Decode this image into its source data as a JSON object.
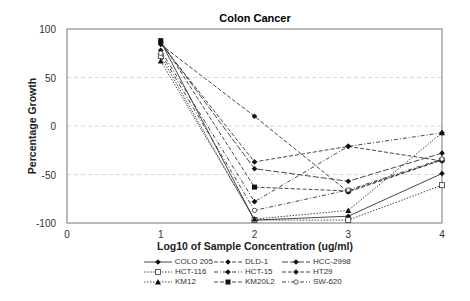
{
  "chart_data": {
    "type": "line",
    "title": "Colon Cancer",
    "xlabel": "Log10 of Sample Concentration (ug/ml)",
    "ylabel": "Percentage Growth",
    "xlim": [
      0,
      4
    ],
    "ylim": [
      -100,
      100
    ],
    "x_ticks": [
      "0",
      "1",
      "2",
      "3",
      "4"
    ],
    "y_ticks": [
      "100",
      "50",
      "0",
      "-50",
      "-100"
    ],
    "grid": "horizontal dashed at 50, 0, -50",
    "legend_position": "bottom",
    "x": [
      1,
      2,
      3,
      4
    ],
    "series": [
      {
        "name": "COLO 205",
        "values": [
          87,
          -97,
          -93,
          -49
        ],
        "marker": "diamond",
        "dash": "solid"
      },
      {
        "name": "DLD-1",
        "values": [
          85,
          -37,
          -21,
          -36
        ],
        "marker": "diamond",
        "dash": "dash"
      },
      {
        "name": "HCC-2998",
        "values": [
          86,
          -44,
          -57,
          -28
        ],
        "marker": "diamond",
        "dash": "longdash"
      },
      {
        "name": "HCT-116",
        "values": [
          72,
          -97,
          -97,
          -61
        ],
        "marker": "open-square",
        "dash": "dot"
      },
      {
        "name": "HCT-15",
        "values": [
          78,
          -78,
          -21,
          -7
        ],
        "marker": "diamond",
        "dash": "dashdot"
      },
      {
        "name": "HT29",
        "values": [
          84,
          10,
          -68,
          -35
        ],
        "marker": "diamond",
        "dash": "dash"
      },
      {
        "name": "KM12",
        "values": [
          67,
          -96,
          -87,
          -7
        ],
        "marker": "triangle",
        "dash": "dot"
      },
      {
        "name": "KM20L2",
        "values": [
          88,
          -63,
          -67,
          -35
        ],
        "marker": "square",
        "dash": "dash"
      },
      {
        "name": "SW-620",
        "values": [
          75,
          -87,
          -66,
          -34
        ],
        "marker": "open-circle",
        "dash": "dashdot"
      }
    ]
  }
}
